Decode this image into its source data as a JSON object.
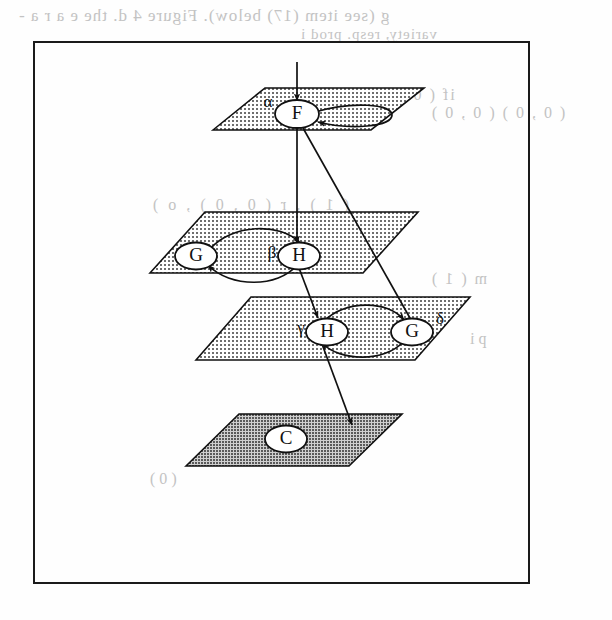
{
  "figure": {
    "frame": {
      "border_color": "#1a1a1a"
    },
    "background_bleed_text": [
      {
        "id": "bleed-line-1",
        "text": "g (see item (17) below). Figure 4 d. the  e a r a -"
      },
      {
        "id": "bleed-line-2",
        "text": "variety, resp. prod i"
      },
      {
        "id": "bleed-line-3",
        "text": "if ( 0 , 0 )  ,  F o r ."
      },
      {
        "id": "bleed-line-4",
        "text": "( 0 , 0 )  (  0 , 0 )"
      },
      {
        "id": "bleed-line-5",
        "text": "( 1 )  ,  r  (  0 , 0 )   ,   o )"
      },
      {
        "id": "bleed-line-6",
        "text": "m  ( 1 )"
      },
      {
        "id": "bleed-line-7",
        "text": "p i"
      },
      {
        "id": "bleed-line-8",
        "text": "( 0 )"
      }
    ],
    "planes": [
      {
        "id": "plane-alpha",
        "name": "top-plane",
        "fill": "#d8d8d8",
        "stipple": "light"
      },
      {
        "id": "plane-beta",
        "name": "second-plane",
        "fill": "#d8d8d8",
        "stipple": "light"
      },
      {
        "id": "plane-gamma",
        "name": "third-plane",
        "fill": "#d8d8d8",
        "stipple": "light"
      },
      {
        "id": "plane-bottom",
        "name": "bottom-plane",
        "fill": "#a8a8a8",
        "stipple": "dense"
      }
    ],
    "nodes": [
      {
        "id": "node-f",
        "label": "F",
        "greek": "α",
        "plane": "plane-alpha"
      },
      {
        "id": "node-g-upper",
        "label": "G",
        "greek": "",
        "plane": "plane-beta"
      },
      {
        "id": "node-h-upper",
        "label": "H",
        "greek": "β",
        "plane": "plane-beta"
      },
      {
        "id": "node-h-lower",
        "label": "H",
        "greek": "γ",
        "plane": "plane-gamma"
      },
      {
        "id": "node-g-lower",
        "label": "G",
        "greek": "δ",
        "plane": "plane-gamma"
      },
      {
        "id": "node-c",
        "label": "C",
        "greek": "",
        "plane": "plane-bottom"
      }
    ],
    "edges": [
      {
        "id": "edge-in-f",
        "from": "external-top",
        "to": "node-f",
        "style": "straight-vertical"
      },
      {
        "id": "edge-f-self",
        "from": "node-f",
        "to": "node-f",
        "style": "self-loop"
      },
      {
        "id": "edge-f-h-upper",
        "from": "node-f",
        "to": "node-h-upper",
        "style": "straight-vertical"
      },
      {
        "id": "edge-f-g-lower",
        "from": "node-f",
        "to": "node-g-lower",
        "style": "straight-diagonal"
      },
      {
        "id": "edge-g-h-upper",
        "from": "node-g-upper",
        "to": "node-h-upper",
        "style": "curve-over"
      },
      {
        "id": "edge-h-g-upper",
        "from": "node-h-upper",
        "to": "node-g-upper",
        "style": "curve-under"
      },
      {
        "id": "edge-h-upper-h-lower",
        "from": "node-h-upper",
        "to": "node-h-lower",
        "style": "straight-diagonal"
      },
      {
        "id": "edge-h-g-lower",
        "from": "node-h-lower",
        "to": "node-g-lower",
        "style": "curve-under"
      },
      {
        "id": "edge-g-h-lower",
        "from": "node-g-lower",
        "to": "node-h-lower",
        "style": "curve-over"
      },
      {
        "id": "edge-h-lower-c",
        "from": "node-h-lower",
        "to": "node-c",
        "style": "straight-diagonal"
      }
    ]
  }
}
